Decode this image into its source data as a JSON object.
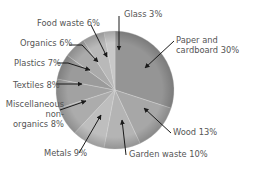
{
  "chart_data": {
    "type": "pie",
    "title": "",
    "categories": [
      "Paper and cardboard",
      "Wood",
      "Garden waste",
      "Metals",
      "Miscellaneous non-organics",
      "Textiles",
      "Plastics",
      "Organics",
      "Food waste",
      "Glass"
    ],
    "values": [
      30,
      13,
      10,
      9,
      8,
      8,
      7,
      6,
      6,
      3
    ],
    "unit": "%",
    "colors": [
      "#959595",
      "#a7a7a7",
      "#b4b4b4",
      "#bebebe",
      "#acacac",
      "#a2a2a2",
      "#9b9b9b",
      "#aaaaaa",
      "#b9b9b9",
      "#c8c8c8"
    ],
    "legend": "none (callout labels with arrows)",
    "center": [
      115,
      90
    ],
    "radius": 59
  },
  "labels": {
    "paper": {
      "line1": "Paper and",
      "line2": "cardboard 30%"
    },
    "wood": "Wood 13%",
    "garden": "Garden waste 10%",
    "metals": "Metals 9%",
    "misc": {
      "line1": "Miscellaneous",
      "line2": "non-",
      "line3": "organics 8%"
    },
    "textiles": "Textiles 8%",
    "plastics": "Plastics 7%",
    "organics": "Organics 6%",
    "food": "Food waste 6%",
    "glass": "Glass 3%"
  }
}
